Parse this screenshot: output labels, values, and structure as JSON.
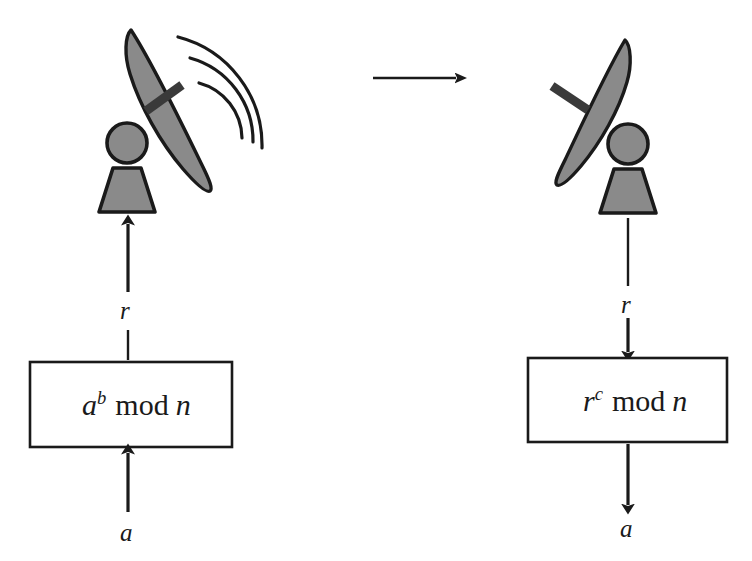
{
  "diagram": {
    "type": "flow-diagram",
    "background_color": "#ffffff",
    "ink_color": "#1a1a1a",
    "figure_fill_color": "#8a8a8a"
  },
  "sender": {
    "antenna_name": "transmitting-satellite-dish",
    "person_name": "sender-person",
    "waves_visible": true,
    "wave_count": 3
  },
  "receiver": {
    "antenna_name": "receiving-satellite-dish",
    "person_name": "receiver-person",
    "waves_visible": false,
    "wave_count": 0
  },
  "transmission": {
    "arrow_name": "transmission-arrow",
    "direction": "right"
  },
  "left_column": {
    "box_formula": {
      "base": "a",
      "exponent": "b",
      "operator": "mod",
      "modulus": "n",
      "text": "a^b mod n"
    },
    "input_label": "a",
    "output_label": "r",
    "input_direction": "up",
    "output_direction": "up"
  },
  "right_column": {
    "box_formula": {
      "base": "r",
      "exponent": "c",
      "operator": "mod",
      "modulus": "n",
      "text": "r^c mod n"
    },
    "input_label": "r",
    "output_label": "a",
    "input_direction": "down",
    "output_direction": "down"
  }
}
